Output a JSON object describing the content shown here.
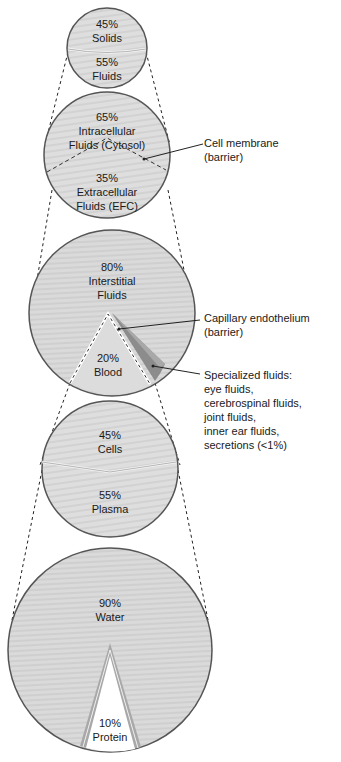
{
  "levels": [
    {
      "id": "body",
      "segments": [
        {
          "percent": "45%",
          "name": "Solids"
        },
        {
          "percent": "55%",
          "name": "Fluids"
        }
      ]
    },
    {
      "id": "fluids",
      "segments": [
        {
          "percent": "65%",
          "name_line1": "Intracellular",
          "name_line2": "Fluids (Cytosol)"
        },
        {
          "percent": "35%",
          "name_line1": "Extracellular",
          "name_line2": "Fluids (EFC)"
        }
      ]
    },
    {
      "id": "extracellular",
      "segments": [
        {
          "percent": "80%",
          "name_line1": "Interstitial",
          "name_line2": "Fluids"
        },
        {
          "percent": "20%",
          "name": "Blood"
        }
      ]
    },
    {
      "id": "blood",
      "segments": [
        {
          "percent": "45%",
          "name": "Cells"
        },
        {
          "percent": "55%",
          "name": "Plasma"
        }
      ]
    },
    {
      "id": "plasma",
      "segments": [
        {
          "percent": "90%",
          "name": "Water"
        },
        {
          "percent": "10%",
          "name": "Protein"
        }
      ]
    }
  ],
  "callouts": {
    "cell_membrane": [
      "Cell membrane",
      "(barrier)"
    ],
    "capillary": [
      "Capillary endothelium",
      "(barrier)"
    ],
    "specialized": [
      "Specialized fluids:",
      "eye fluids,",
      "cerebrospinal fluids,",
      "joint fluids,",
      "inner ear fluids,",
      "secretions (<1%)"
    ]
  },
  "colors": {
    "fill": "#dcdcdc",
    "fill_light": "#e6e6e6",
    "outline": "#555555",
    "dark_wedge": "#8c8c8c",
    "mid_wedge": "#a8a8a8",
    "white": "#ffffff"
  }
}
